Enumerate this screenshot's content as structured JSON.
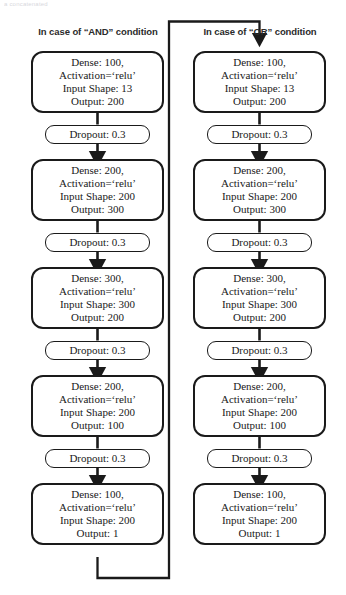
{
  "page": {
    "top_artifact_text": "a concatenated",
    "background_color": "#ffffff",
    "line_color": "#1a1a1a",
    "text_color": "#1a1a1a"
  },
  "headers": {
    "left": "In case of “AND” condition",
    "right": "In case of “OR” condition"
  },
  "columns": [
    {
      "id": "and",
      "header": "In case of “AND” condition",
      "nodes": [
        {
          "type": "dense",
          "lines": [
            "Dense: 100,",
            "Activation=‘relu’",
            "Input Shape: 13",
            "Output: 200"
          ]
        },
        {
          "type": "dropout",
          "lines": [
            "Dropout: 0.3"
          ]
        },
        {
          "type": "dense",
          "lines": [
            "Dense: 200,",
            "Activation=‘relu’",
            "Input Shape: 200",
            "Output: 300"
          ]
        },
        {
          "type": "dropout",
          "lines": [
            "Dropout: 0.3"
          ]
        },
        {
          "type": "dense",
          "lines": [
            "Dense: 300,",
            "Activation=‘relu’",
            "Input Shape: 300",
            "Output: 200"
          ]
        },
        {
          "type": "dropout",
          "lines": [
            "Dropout: 0.3"
          ]
        },
        {
          "type": "dense",
          "lines": [
            "Dense: 200,",
            "Activation=‘relu’",
            "Input Shape: 200",
            "Output: 100"
          ]
        },
        {
          "type": "dropout",
          "lines": [
            "Dropout: 0.3"
          ]
        },
        {
          "type": "dense",
          "lines": [
            "Dense: 100,",
            "Activation=‘relu’",
            "Input Shape: 200",
            "Output: 1"
          ]
        }
      ]
    },
    {
      "id": "or",
      "header": "In case of “OR” condition",
      "nodes": [
        {
          "type": "dense",
          "lines": [
            "Dense: 100,",
            "Activation=‘relu’",
            "Input Shape: 13",
            "Output: 200"
          ]
        },
        {
          "type": "dropout",
          "lines": [
            "Dropout: 0.3"
          ]
        },
        {
          "type": "dense",
          "lines": [
            "Dense: 200,",
            "Activation=‘relu’",
            "Input Shape: 200",
            "Output: 300"
          ]
        },
        {
          "type": "dropout",
          "lines": [
            "Dropout: 0.3"
          ]
        },
        {
          "type": "dense",
          "lines": [
            "Dense: 300,",
            "Activation=‘relu’",
            "Input Shape: 300",
            "Output: 200"
          ]
        },
        {
          "type": "dropout",
          "lines": [
            "Dropout: 0.3"
          ]
        },
        {
          "type": "dense",
          "lines": [
            "Dense: 200,",
            "Activation=‘relu’",
            "Input Shape: 200",
            "Output: 100"
          ]
        },
        {
          "type": "dropout",
          "lines": [
            "Dropout: 0.3"
          ]
        },
        {
          "type": "dense",
          "lines": [
            "Dense: 100,",
            "Activation=‘relu’",
            "Input Shape: 200",
            "Output: 1"
          ]
        }
      ]
    }
  ],
  "cross_connector": {
    "description": "From bottom of left column final layer, right and up over the headers, then down with arrow into the first node of the right column."
  }
}
